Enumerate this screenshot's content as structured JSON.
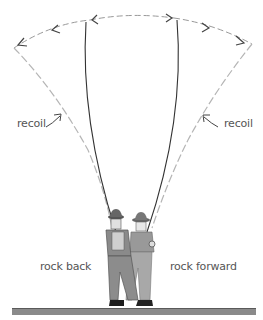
{
  "diagram": {
    "labels": {
      "recoil_left": "recoil",
      "recoil_right": "recoil",
      "rock_back": "rock back",
      "rock_forward": "rock forward"
    },
    "elements": {
      "arc": "dashed casting arc with double arrows",
      "rods": "two rod positions: back cast and forward cast",
      "recoil_paths": "dashed gray recoil lines from rod tips",
      "figures": "two angler figures rocking back and forward",
      "ground": "ground line"
    },
    "colors": {
      "rod": "#333333",
      "recoil_line": "#b5b5b5",
      "arc": "#888888",
      "arrow": "#444444",
      "ground": "#8a8a8a",
      "text": "#555555"
    }
  }
}
